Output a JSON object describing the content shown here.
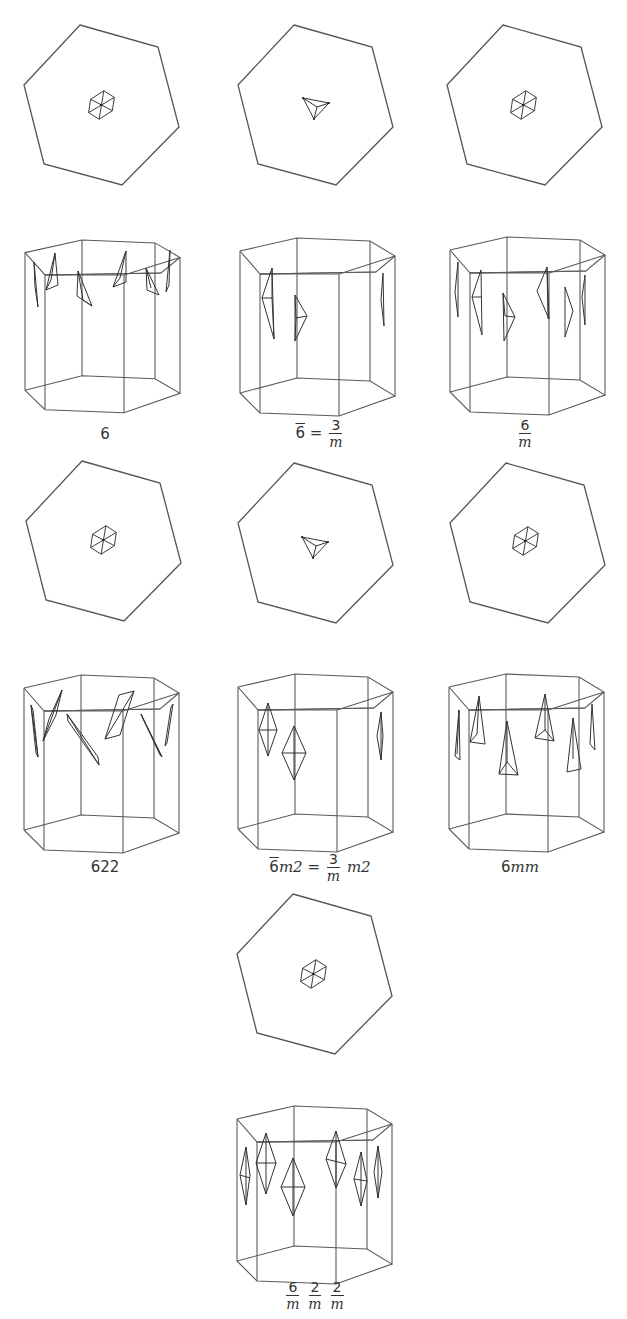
{
  "figure": {
    "stroke_color": "#555555",
    "background": "#ffffff",
    "panels": [
      {
        "id": "p6",
        "row": 1,
        "col": 1,
        "label": "6",
        "top_motif": "hexagram-star-6",
        "prism_motif": "tetrahedra-rotated"
      },
      {
        "id": "p6bar",
        "row": 1,
        "col": 2,
        "label_parts": {
          "lhs": "6̄",
          "eq": "=",
          "num": "3",
          "den": "m"
        },
        "label": "6̄ = 3/m",
        "top_motif": "triangle-3",
        "prism_motif": "double-tetrahedra-3"
      },
      {
        "id": "p6m",
        "row": 1,
        "col": 3,
        "label_parts": {
          "num": "6",
          "den": "m"
        },
        "label": "6/m",
        "top_motif": "hexagram-star-6",
        "prism_motif": "double-tetrahedra-6"
      },
      {
        "id": "p622",
        "row": 2,
        "col": 1,
        "label": "622",
        "top_motif": "hexagram-star-6",
        "prism_motif": "twisted-rhombs"
      },
      {
        "id": "p6barm2",
        "row": 2,
        "col": 2,
        "label_parts": {
          "lhs": "6̄",
          "lhs_suffix": "m2",
          "eq": "=",
          "num": "3",
          "den": "m",
          "rhs_suffix": "m2"
        },
        "label": "6̄m2 = 3/m m2",
        "top_motif": "triangle-3",
        "prism_motif": "bipyramids-3"
      },
      {
        "id": "p6mm",
        "row": 2,
        "col": 3,
        "label_parts": {
          "num": "6",
          "italic": "mm"
        },
        "label": "6mm",
        "top_motif": "hexagram-star-6",
        "prism_motif": "pyramids-6"
      },
      {
        "id": "p6mmm",
        "row": 3,
        "col": 2,
        "label_parts": [
          {
            "num": "6",
            "den": "m"
          },
          {
            "num": "2",
            "den": "m"
          },
          {
            "num": "2",
            "den": "m"
          }
        ],
        "label": "6/m 2/m 2/m",
        "top_motif": "hexagram-star-6",
        "prism_motif": "bipyramids-6"
      }
    ]
  },
  "labels": {
    "l6": "6",
    "l6bar_lhs": "6",
    "l6bar_eq": "=",
    "l6bar_num": "3",
    "l6bar_den": "m",
    "l6m_num": "6",
    "l6m_den": "m",
    "l622": "622",
    "l6barm2_lhs": "6",
    "l6barm2_m2": "m2",
    "l6barm2_eq": "=",
    "l6barm2_num": "3",
    "l6barm2_den": "m",
    "l6barm2_rhs": "m2",
    "l6mm_num": "6",
    "l6mm_it": "mm",
    "l6mmm_n1": "6",
    "l6mmm_d1": "m",
    "l6mmm_n2": "2",
    "l6mmm_d2": "m",
    "l6mmm_n3": "2",
    "l6mmm_d3": "m"
  }
}
